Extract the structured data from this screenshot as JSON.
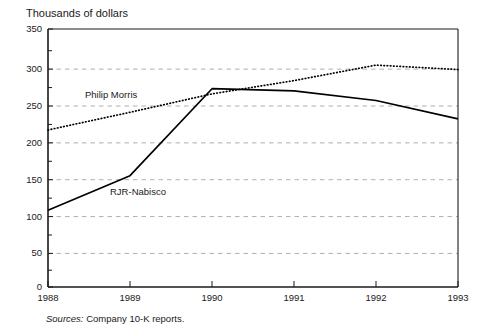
{
  "figure": {
    "title": "Thousands of dollars",
    "source_prefix": "Sources:",
    "source_text": " Company 10-K reports."
  },
  "axes": {
    "y_ticks": [
      "350",
      "300",
      "250",
      "200",
      "150",
      "100",
      "50",
      "0"
    ],
    "x_ticks": [
      "1988",
      "1989",
      "1990",
      "1991",
      "1992",
      "1993"
    ]
  },
  "labels": {
    "philip_morris": "Philip Morris",
    "rjr_nabisco": "RJR-Nabisco"
  },
  "colors": {
    "axis": "#1a1a1a",
    "grid": "#999999",
    "line": "#000000"
  },
  "chart_data": {
    "type": "line",
    "title": "Thousands of dollars",
    "xlabel": "",
    "ylabel": "Thousands of dollars",
    "x": [
      1988,
      1989,
      1990,
      1991,
      1992,
      1993
    ],
    "xlim": [
      1988,
      1993
    ],
    "ylim": [
      0,
      350
    ],
    "yticks": [
      0,
      50,
      100,
      150,
      200,
      250,
      300,
      350
    ],
    "ygrid": true,
    "grid_style": "dashed",
    "legend": "inline-labels",
    "series": [
      {
        "name": "Philip Morris",
        "style": "dotted",
        "values": [
          213,
          237,
          262,
          280,
          301,
          295
        ]
      },
      {
        "name": "RJR-Nabisco",
        "style": "solid",
        "values": [
          104,
          151,
          269,
          266,
          253,
          228
        ]
      }
    ],
    "annotations": [
      {
        "text": "Philip Morris",
        "x": 1988.6,
        "y": 272
      },
      {
        "text": "RJR-Nabisco",
        "x": 1989.0,
        "y": 138
      }
    ]
  }
}
